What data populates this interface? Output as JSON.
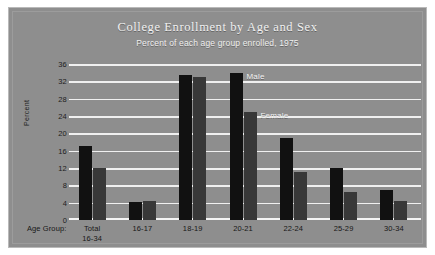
{
  "chart_data": {
    "type": "bar",
    "title": "College Enrollment by Age and Sex",
    "subtitle": "Percent of each age group enrolled, 1975",
    "xlabel": "Age Group:",
    "ylabel": "Percent",
    "ylim": [
      0,
      36
    ],
    "ytick_labels": [
      "36",
      "32",
      "28",
      "24",
      "20",
      "16",
      "12",
      "8",
      "4",
      "0"
    ],
    "ytick_values": [
      36,
      32,
      28,
      24,
      20,
      16,
      12,
      8,
      4,
      0
    ],
    "grid": true,
    "legend_position": "inline-annotation",
    "categories": [
      "Total\n16-34",
      "16-17",
      "18-19",
      "20-21",
      "22-24",
      "25-29",
      "30-34"
    ],
    "category_labels": [
      {
        "line1": "Total",
        "line2": "16-34"
      },
      {
        "line1": "16-17",
        "line2": ""
      },
      {
        "line1": "18-19",
        "line2": ""
      },
      {
        "line1": "20-21",
        "line2": ""
      },
      {
        "line1": "22-24",
        "line2": ""
      },
      {
        "line1": "25-29",
        "line2": ""
      },
      {
        "line1": "30-34",
        "line2": ""
      }
    ],
    "series": [
      {
        "name": "Male",
        "color": "#111111",
        "values": [
          17.0,
          4.2,
          33.5,
          34.0,
          19.0,
          12.0,
          7.0
        ]
      },
      {
        "name": "Female",
        "color": "#383838",
        "values": [
          12.0,
          4.5,
          33.0,
          25.0,
          11.0,
          6.5,
          4.5
        ]
      }
    ],
    "annotations": [
      {
        "text": "Male",
        "category": "20-21",
        "series": "Male"
      },
      {
        "text": "Female",
        "category": "20-21",
        "series": "Female"
      }
    ]
  },
  "colors": {
    "background": "#8e8e8e",
    "page": "#ffffff",
    "gridline": "#f0f0f0",
    "title_text": "#f2f2f2",
    "axis_text": "#1d1d1d",
    "male_bar": "#111111",
    "female_bar": "#383838"
  }
}
